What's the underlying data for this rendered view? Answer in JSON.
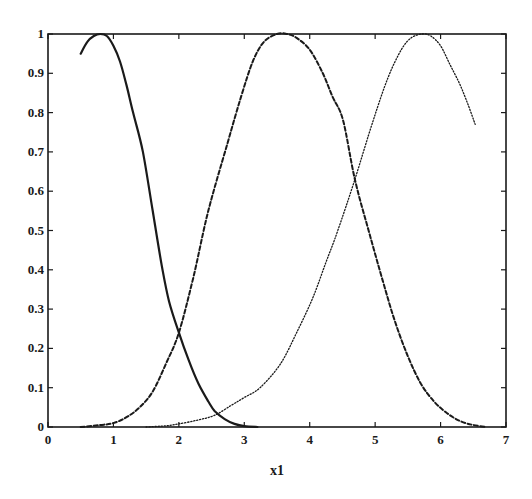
{
  "chart_data": {
    "type": "line",
    "title": "",
    "xlabel": "x1",
    "ylabel": "",
    "xlim": [
      0,
      7
    ],
    "ylim": [
      0,
      1
    ],
    "grid": false,
    "legend": null,
    "x_ticks": [
      "0",
      "1",
      "2",
      "3",
      "4",
      "5",
      "6",
      "7"
    ],
    "y_ticks": [
      "0",
      "0.1",
      "0.2",
      "0.3",
      "0.4",
      "0.5",
      "0.6",
      "0.7",
      "0.8",
      "0.9",
      "1"
    ],
    "series": [
      {
        "name": "membership function 1",
        "style": "solid",
        "points": [
          [
            0.5,
            0.95
          ],
          [
            0.6,
            0.98
          ],
          [
            0.7,
            0.995
          ],
          [
            0.8,
            1.0
          ],
          [
            0.9,
            0.995
          ],
          [
            1.0,
            0.97
          ],
          [
            1.1,
            0.93
          ],
          [
            1.2,
            0.87
          ],
          [
            1.3,
            0.8
          ],
          [
            1.45,
            0.7
          ],
          [
            1.6,
            0.55
          ],
          [
            1.74,
            0.41
          ],
          [
            1.85,
            0.32
          ],
          [
            2.0,
            0.24
          ],
          [
            2.15,
            0.17
          ],
          [
            2.3,
            0.11
          ],
          [
            2.45,
            0.065
          ],
          [
            2.55,
            0.04
          ],
          [
            2.7,
            0.02
          ],
          [
            2.85,
            0.008
          ],
          [
            3.0,
            0.002
          ],
          [
            3.2,
            0.0
          ]
        ]
      },
      {
        "name": "membership function 2",
        "style": "dashed",
        "points": [
          [
            0.5,
            0.0
          ],
          [
            0.8,
            0.005
          ],
          [
            1.0,
            0.01
          ],
          [
            1.2,
            0.025
          ],
          [
            1.4,
            0.05
          ],
          [
            1.6,
            0.09
          ],
          [
            1.8,
            0.16
          ],
          [
            2.0,
            0.24
          ],
          [
            2.22,
            0.38
          ],
          [
            2.45,
            0.55
          ],
          [
            2.74,
            0.72
          ],
          [
            2.95,
            0.84
          ],
          [
            3.13,
            0.93
          ],
          [
            3.3,
            0.98
          ],
          [
            3.5,
            1.0
          ],
          [
            3.65,
            1.0
          ],
          [
            3.8,
            0.99
          ],
          [
            4.0,
            0.96
          ],
          [
            4.2,
            0.9
          ],
          [
            4.35,
            0.84
          ],
          [
            4.51,
            0.78
          ],
          [
            4.69,
            0.63
          ],
          [
            4.9,
            0.5
          ],
          [
            5.12,
            0.37
          ],
          [
            5.3,
            0.27
          ],
          [
            5.5,
            0.18
          ],
          [
            5.7,
            0.11
          ],
          [
            5.9,
            0.065
          ],
          [
            6.1,
            0.035
          ],
          [
            6.3,
            0.015
          ],
          [
            6.5,
            0.005
          ],
          [
            6.7,
            0.0
          ]
        ]
      },
      {
        "name": "membership function 3",
        "style": "dotted",
        "points": [
          [
            1.5,
            0.0
          ],
          [
            1.8,
            0.003
          ],
          [
            2.0,
            0.008
          ],
          [
            2.3,
            0.018
          ],
          [
            2.55,
            0.03
          ],
          [
            2.8,
            0.055
          ],
          [
            3.0,
            0.075
          ],
          [
            3.24,
            0.1
          ],
          [
            3.55,
            0.16
          ],
          [
            3.8,
            0.24
          ],
          [
            4.05,
            0.33
          ],
          [
            4.25,
            0.42
          ],
          [
            4.43,
            0.5
          ],
          [
            4.69,
            0.63
          ],
          [
            4.97,
            0.78
          ],
          [
            5.2,
            0.89
          ],
          [
            5.4,
            0.96
          ],
          [
            5.55,
            0.99
          ],
          [
            5.72,
            1.0
          ],
          [
            5.85,
            0.995
          ],
          [
            6.0,
            0.97
          ],
          [
            6.15,
            0.92
          ],
          [
            6.3,
            0.87
          ],
          [
            6.42,
            0.82
          ],
          [
            6.53,
            0.77
          ]
        ]
      }
    ]
  },
  "labels": {
    "xlabel": "x1"
  }
}
